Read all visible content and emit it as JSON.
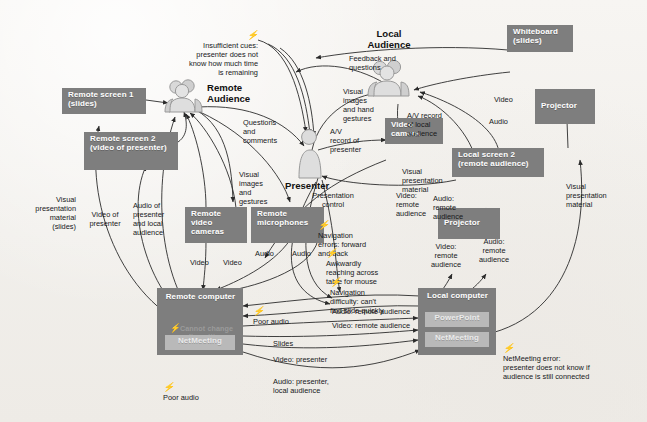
{
  "diagram": {
    "colors": {
      "background": "#f2f0ed",
      "node_fill": "#7e7e7e",
      "app_fill": "#b9b9b9",
      "text_on_node": "#ffffff",
      "edge": "#2b2b2b",
      "note_text": "#16181a",
      "muted_note": "#9b9b9b"
    }
  },
  "actors": [
    {
      "id": "remote-audience",
      "name": "Remote\nAudience",
      "icon": "people-group-icon"
    },
    {
      "id": "local-audience",
      "name": "Local\nAudience",
      "icon": "people-group-icon"
    },
    {
      "id": "presenter",
      "name": "Presenter",
      "icon": "person-icon"
    }
  ],
  "nodes": [
    {
      "id": "remote-screen-1",
      "label": "Remote screen 1\n(slides)"
    },
    {
      "id": "remote-screen-2",
      "label": "Remote screen 2\n(video of\npresenter)"
    },
    {
      "id": "remote-video-cameras",
      "label": "Remote\nvideo\ncameras"
    },
    {
      "id": "remote-microphones",
      "label": "Remote\nmicrophones"
    },
    {
      "id": "remote-computer",
      "label": "Remote\ncomputer"
    },
    {
      "id": "local-computer",
      "label": "Local\ncomputer"
    },
    {
      "id": "video-camera",
      "label": "Video\ncamera"
    },
    {
      "id": "whiteboard",
      "label": "Whiteboard\n(slides)"
    },
    {
      "id": "projector-top",
      "label": "Projector"
    },
    {
      "id": "projector-bottom",
      "label": "Projector"
    },
    {
      "id": "local-screen-2",
      "label": "Local screen 2\n(remote audience)"
    }
  ],
  "apps": [
    {
      "id": "remote-netmeeting",
      "label": "NetMeeting",
      "parent": "remote-computer"
    },
    {
      "id": "local-powerpoint",
      "label": "PowerPoint",
      "parent": "local-computer"
    },
    {
      "id": "local-netmeeting",
      "label": "NetMeeting",
      "parent": "local-computer"
    }
  ],
  "in_node_notes": [
    {
      "id": "cannot-change-audio",
      "label": "Cannot change\naudio setting",
      "parent": "remote-computer",
      "has_bolt": true
    }
  ],
  "breakdowns": [
    {
      "id": "insufficient-cues",
      "label": "Insufficient cues:\npresenter does not\nknow how much time\nis remaining"
    },
    {
      "id": "navigation-errors",
      "label": "Navigation\nerrors: forward\nand back"
    },
    {
      "id": "awkward-reaching",
      "label": "Awkwardly\nreaching across\ntable for mouse"
    },
    {
      "id": "navigation-difficulty",
      "label": "Navigation\ndifficulty: can't\nfind slide quickly"
    },
    {
      "id": "poor-audio-top",
      "label": "Poor audio"
    },
    {
      "id": "poor-audio-bottom",
      "label": "Poor audio"
    },
    {
      "id": "netmeeting-error",
      "label": "NetMeeting error:\npresenter does not know if\naudience is still connected"
    }
  ],
  "edge_labels": [
    {
      "id": "questions-and-comments",
      "label": "Questions\nand\ncomments"
    },
    {
      "id": "visual-images-and-gestures-remote",
      "label": "Visual\nimages\nand\ngestures"
    },
    {
      "id": "visual-presentation-material-slides",
      "label": "Visual\npresentation\nmaterial\n(slides)"
    },
    {
      "id": "video-of-presenter",
      "label": "Video of\npresenter"
    },
    {
      "id": "audio-of-presenter-and-local-audience",
      "label": "Audio of\npresenter\nand local\naudience"
    },
    {
      "id": "video-left",
      "label": "Video"
    },
    {
      "id": "video-right",
      "label": "Video"
    },
    {
      "id": "audio-left",
      "label": "Audio"
    },
    {
      "id": "audio-right",
      "label": "Audio"
    },
    {
      "id": "feedback-and-questions",
      "label": "Feedback and\nquestions"
    },
    {
      "id": "visual-images-and-hand-gestures",
      "label": "Visual\nimages\nand hand\ngestures"
    },
    {
      "id": "av-record-of-presenter",
      "label": "A/V\nrecord of\npresenter"
    },
    {
      "id": "av-record-of-local-audience",
      "label": "A/V record\nof local\naudience"
    },
    {
      "id": "video-to-local-audience",
      "label": "Video"
    },
    {
      "id": "audio-to-local-audience",
      "label": "Audio"
    },
    {
      "id": "visual-presentation-material-presenter",
      "label": "Visual\npresentation\nmaterial"
    },
    {
      "id": "visual-presentation-material-right",
      "label": "Visual\npresentation\nmaterial"
    },
    {
      "id": "presentation-control",
      "label": "Presentation\ncontrol"
    },
    {
      "id": "video-remote-audience-presenter",
      "label": "Video:\nremote\naudience"
    },
    {
      "id": "audio-remote-audience-presenter",
      "label": "Audio:\nremote\naudience"
    },
    {
      "id": "video-remote-audience-projector",
      "label": "Video:\nremote\naudience"
    },
    {
      "id": "audio-remote-audience-projector",
      "label": "Audio:\nremote\naudience"
    },
    {
      "id": "audio-remote-audience-link",
      "label": "Audio: remote audience"
    },
    {
      "id": "video-remote-audience-link",
      "label": "Video: remote audience"
    },
    {
      "id": "slides-link",
      "label": "Slides"
    },
    {
      "id": "video-presenter-link",
      "label": "Video: presenter"
    },
    {
      "id": "audio-presenter-local-audience-link",
      "label": "Audio: presenter,\nlocal audience"
    }
  ]
}
